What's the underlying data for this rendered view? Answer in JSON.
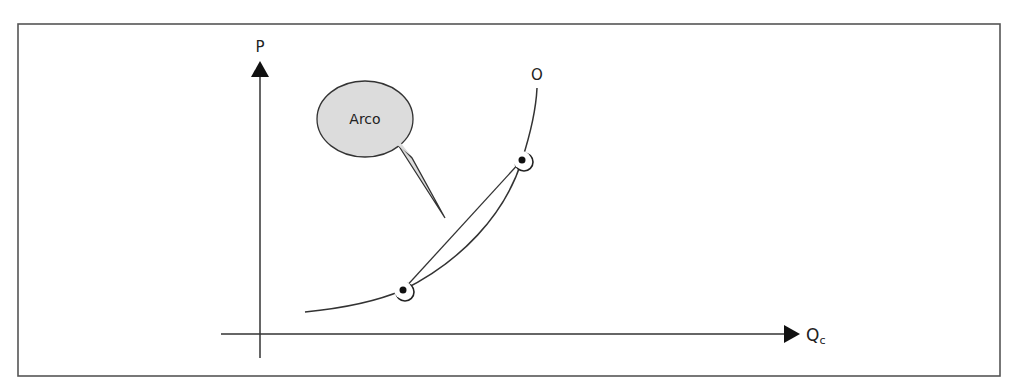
{
  "diagram": {
    "type": "supply-curve-arc-elasticity",
    "frame": {
      "stroke": "#555555"
    },
    "axes": {
      "y_label": "P",
      "x_label_main": "Q",
      "x_label_sub": "c",
      "color": "#333333"
    },
    "curve": {
      "label": "O",
      "color": "#333333"
    },
    "points": [
      {
        "name": "lower-point",
        "x": 403,
        "y": 290
      },
      {
        "name": "upper-point",
        "x": 522,
        "y": 160
      }
    ],
    "callout": {
      "text": "Arco",
      "fill": "#dcdcdc",
      "stroke": "#333333"
    }
  }
}
